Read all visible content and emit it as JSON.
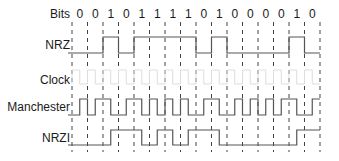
{
  "diagram": {
    "labels": {
      "bits": "Bits",
      "nrz": "NRZ",
      "clock": "Clock",
      "manchester": "Manchester",
      "nrzi": "NRZI"
    },
    "bits": [
      "0",
      "0",
      "1",
      "0",
      "1",
      "1",
      "1",
      "1",
      "0",
      "1",
      "0",
      "0",
      "0",
      "0",
      "1",
      "0"
    ],
    "colors": {
      "signal": "#555555",
      "clock": "#dddddd",
      "gridline": "#444444",
      "text": "#1a1a1a"
    },
    "encodings": {
      "nrz": "high for 1, low for 0",
      "manchester": "0 = low-to-high, 1 = high-to-low at mid-bit",
      "nrzi": "transition at mid-bit on 1"
    }
  }
}
